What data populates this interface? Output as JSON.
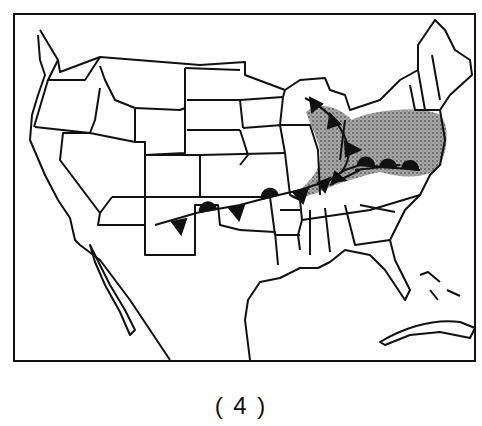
{
  "figure": {
    "caption": "( 4 )",
    "map_region": "Contiguous United States",
    "features": {
      "precipitation_area": {
        "label": "shaded precipitation area",
        "color": "#9a9a9a"
      },
      "cold_front": {
        "label": "cold front"
      },
      "warm_front": {
        "label": "warm front"
      },
      "stationary_front": {
        "label": "stationary front"
      }
    },
    "colors": {
      "line": "#111111",
      "background": "#ffffff",
      "shade": "#9a9a9a"
    }
  }
}
